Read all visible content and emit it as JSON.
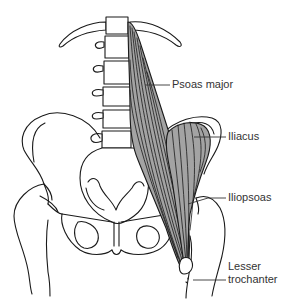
{
  "figure": {
    "colors": {
      "background": "#ffffff",
      "bone_outline": "#1a1a1a",
      "muscle_fill": "#a3a3a3",
      "label_text": "#333333"
    },
    "labels": [
      {
        "id": "psoas-major",
        "text": "Psoas major"
      },
      {
        "id": "iliacus",
        "text": "Iliacus"
      },
      {
        "id": "iliopsoas",
        "text": "Iliopsoas"
      },
      {
        "id": "lesser-trochanter",
        "text_line1": "Lesser",
        "text_line2": "trochanter"
      }
    ]
  }
}
